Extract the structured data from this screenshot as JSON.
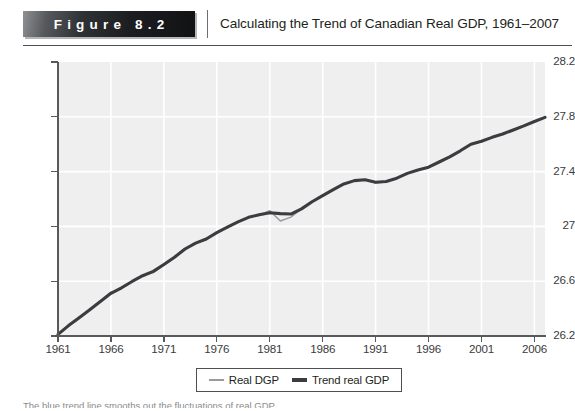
{
  "header": {
    "badge_label": "Figure 8.2",
    "title": "Calculating the Trend of Canadian Real GDP, 1961–2007"
  },
  "caption": {
    "text": "The blue trend line smooths out the fluctuations of real GDP."
  },
  "legend": {
    "items": [
      {
        "label": "Real DGP",
        "style": "thin",
        "color": "#9a9b9e"
      },
      {
        "label": "Trend real GDP",
        "style": "thick",
        "color": "#3a3c3f"
      }
    ]
  },
  "colors": {
    "plot_background": "#efeff0",
    "gridline": "#ffffff",
    "axis": "#58595b",
    "actual_series": "#9a9b9e",
    "trend_series": "#3a3c3f",
    "badge_text": "#ffffff",
    "text": "#231f20"
  },
  "chart_data": {
    "type": "line",
    "title": "Calculating the Trend of Canadian Real GDP, 1961–2007",
    "xlabel": "",
    "ylabel": "",
    "xlim": [
      1961,
      2007
    ],
    "ylim": [
      26.2,
      28.2
    ],
    "grid": true,
    "legend_position": "bottom-center",
    "y_ticks": [
      "28.2",
      "27.8",
      "27.4",
      "27",
      "26.6",
      "26.2"
    ],
    "y_tick_values": [
      28.2,
      27.8,
      27.4,
      27.0,
      26.6,
      26.2
    ],
    "x_ticks": [
      "1961",
      "1966",
      "1971",
      "1976",
      "1981",
      "1986",
      "1991",
      "1996",
      "2001",
      "2006"
    ],
    "x_tick_values": [
      1961,
      1966,
      1971,
      1976,
      1981,
      1986,
      1991,
      1996,
      2001,
      2006
    ],
    "x": [
      1961,
      1962,
      1963,
      1964,
      1965,
      1966,
      1967,
      1968,
      1969,
      1970,
      1971,
      1972,
      1973,
      1974,
      1975,
      1976,
      1977,
      1978,
      1979,
      1980,
      1981,
      1982,
      1983,
      1984,
      1985,
      1986,
      1987,
      1988,
      1989,
      1990,
      1991,
      1992,
      1993,
      1994,
      1995,
      1996,
      1997,
      1998,
      1999,
      2000,
      2001,
      2002,
      2003,
      2004,
      2005,
      2006,
      2007
    ],
    "series": [
      {
        "name": "Real DGP",
        "style": "thin",
        "color": "#9a9b9e",
        "values": [
          26.215,
          26.281,
          26.33,
          26.395,
          26.455,
          26.52,
          26.546,
          26.597,
          26.644,
          26.663,
          26.717,
          26.77,
          26.84,
          26.88,
          26.902,
          26.958,
          26.993,
          27.031,
          27.069,
          27.082,
          27.115,
          27.04,
          27.068,
          27.13,
          27.185,
          27.227,
          27.265,
          27.312,
          27.336,
          27.342,
          27.317,
          27.326,
          27.35,
          27.389,
          27.414,
          27.43,
          27.47,
          27.507,
          27.552,
          27.602,
          27.62,
          27.652,
          27.672,
          27.702,
          27.732,
          27.766,
          27.795
        ]
      },
      {
        "name": "Trend real GDP",
        "style": "thick",
        "color": "#3a3c3f",
        "values": [
          26.212,
          26.276,
          26.334,
          26.392,
          26.452,
          26.512,
          26.552,
          26.598,
          26.64,
          26.672,
          26.722,
          26.775,
          26.835,
          26.878,
          26.908,
          26.955,
          26.995,
          27.033,
          27.066,
          27.085,
          27.1,
          27.093,
          27.09,
          27.128,
          27.18,
          27.225,
          27.268,
          27.31,
          27.334,
          27.34,
          27.322,
          27.328,
          27.352,
          27.387,
          27.412,
          27.432,
          27.47,
          27.508,
          27.552,
          27.6,
          27.622,
          27.65,
          27.674,
          27.704,
          27.734,
          27.766,
          27.796
        ]
      }
    ]
  }
}
